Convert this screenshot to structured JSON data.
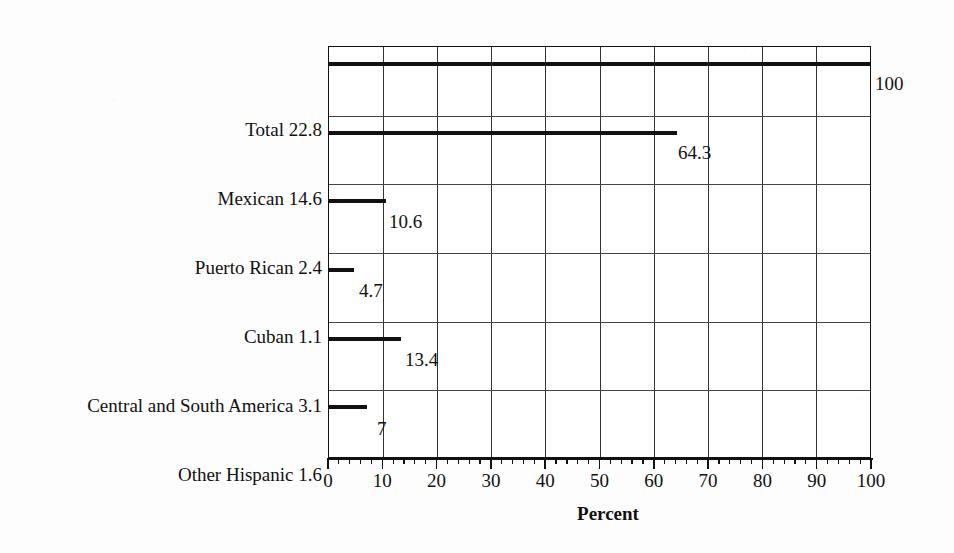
{
  "chart_data": {
    "type": "bar",
    "orientation": "horizontal",
    "title": "",
    "xlabel": "Percent",
    "ylabel": "",
    "xlim": [
      0,
      100
    ],
    "xticks": [
      0,
      10,
      20,
      30,
      40,
      50,
      60,
      70,
      80,
      90,
      100
    ],
    "xtick_labels": [
      "0",
      "10",
      "20",
      "30",
      "40",
      "50",
      "60",
      "70",
      "80",
      "90",
      "100"
    ],
    "minor_tick_step": 2,
    "grid": "vertical-major-and-row-separators",
    "legend": "none",
    "bar_fill_color": "#5a5a5a",
    "bar_edge_color": "#111111",
    "categories": [
      "Total 22.8",
      "Mexican 14.6",
      "Puerto Rican 2.4",
      "Cuban 1.1",
      "Central and South America 3.1",
      "Other Hispanic 1.6"
    ],
    "values": [
      100,
      64.3,
      10.6,
      4.7,
      13.4,
      7
    ],
    "value_labels": [
      "100",
      "64.3",
      "10.6",
      "4.7",
      "13.4",
      "7"
    ],
    "group_counts_millions": [
      22.8,
      14.6,
      2.4,
      1.1,
      3.1,
      1.6
    ]
  },
  "axis": {
    "x_title": "Percent"
  }
}
